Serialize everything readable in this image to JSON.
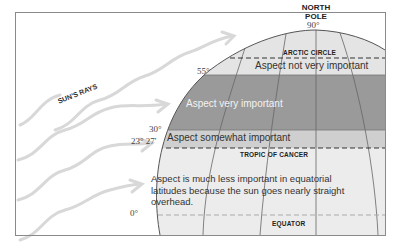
{
  "diagram": {
    "north_pole_label": [
      "NORTH",
      "POLE"
    ],
    "latitudes": {
      "pole": "90°",
      "lat55": "55°",
      "lat30": "30°",
      "tropic": "23° 27'",
      "equator": "0°"
    },
    "lines": {
      "arctic_circle": "ARCTIC CIRCLE",
      "tropic_of_cancer": "TROPIC OF CANCER",
      "equator": "EQUATOR"
    },
    "zones": {
      "polar": "Aspect not very important",
      "mid": "Aspect very important",
      "subtropical": "Aspect somewhat important",
      "equatorial": "Aspect is much less important in equatorial latitudes because the sun goes nearly straight overhead."
    },
    "sun_rays_label": "SUN'S RAYS",
    "colors": {
      "frame": "#8a8a8a",
      "polar_fill": "#e4e4e4",
      "mid_fill": "#9a9a9a",
      "subtropical_fill": "#cfcfcf",
      "equatorial_fill": "#ececec",
      "rays": "#d6d6d6"
    }
  }
}
